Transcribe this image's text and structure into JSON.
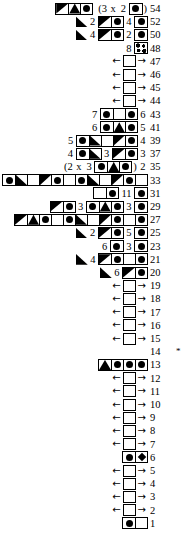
{
  "meta": {
    "row_number_note": "*",
    "colors": {
      "ink": "#000000",
      "paper": "#ffffff"
    }
  },
  "legend": {
    "dot": "filled-circle",
    "diamond": "filled-diamond",
    "blank": "empty-cell",
    "tri_ul": "triangle-lower-left",
    "tri_dl": "triangle-upper-left",
    "peak": "triangle-up",
    "speckle": "speckled-cell"
  },
  "rows": [
    {
      "num": "54",
      "star": "",
      "items": [
        {
          "t": "grid",
          "cells": [
            "tri_dl",
            "peak",
            "dot"
          ]
        },
        {
          "t": "gap"
        },
        {
          "t": "paren",
          "v": "(3"
        },
        {
          "t": "num",
          "v": "x"
        },
        {
          "t": "num",
          "v": "2"
        },
        {
          "t": "grid",
          "cells": [
            "dot"
          ]
        },
        {
          "t": "paren",
          "v": ")"
        }
      ]
    },
    {
      "num": "52",
      "star": "",
      "items": [
        {
          "t": "tri",
          "d": "ul"
        },
        {
          "t": "num",
          "v": "2"
        },
        {
          "t": "grid",
          "cells": [
            "tri_dl",
            "dot"
          ]
        },
        {
          "t": "num",
          "v": "4"
        },
        {
          "t": "grid",
          "cells": [
            "dot"
          ]
        }
      ]
    },
    {
      "num": "50",
      "star": "",
      "items": [
        {
          "t": "tri",
          "d": "ul"
        },
        {
          "t": "num",
          "v": "4"
        },
        {
          "t": "grid",
          "cells": [
            "tri_dl",
            "dot"
          ]
        },
        {
          "t": "num",
          "v": "2"
        },
        {
          "t": "grid",
          "cells": [
            "dot"
          ]
        }
      ]
    },
    {
      "num": "48",
      "star": "",
      "items": [
        {
          "t": "num",
          "v": "8"
        },
        {
          "t": "grid",
          "cells": [
            "speckle"
          ]
        }
      ]
    },
    {
      "num": "47",
      "star": "",
      "items": [
        {
          "t": "arrowbox"
        }
      ]
    },
    {
      "num": "46",
      "star": "",
      "items": [
        {
          "t": "arrowbox"
        }
      ]
    },
    {
      "num": "45",
      "star": "",
      "items": [
        {
          "t": "arrowbox"
        }
      ]
    },
    {
      "num": "44",
      "star": "",
      "items": [
        {
          "t": "arrowbox"
        }
      ]
    },
    {
      "num": "43",
      "star": "",
      "items": [
        {
          "t": "num",
          "v": "7"
        },
        {
          "t": "grid",
          "cells": [
            "dot",
            "blank",
            "dot"
          ]
        },
        {
          "t": "num",
          "v": "6"
        }
      ]
    },
    {
      "num": "41",
      "star": "",
      "items": [
        {
          "t": "num",
          "v": "6"
        },
        {
          "t": "grid",
          "cells": [
            "dot",
            "peak",
            "dot"
          ]
        },
        {
          "t": "num",
          "v": "5"
        }
      ]
    },
    {
      "num": "39",
      "star": "",
      "items": [
        {
          "t": "num",
          "v": "5"
        },
        {
          "t": "grid",
          "cells": [
            "dot",
            "tri_ul",
            "blank",
            "tri_dl",
            "dot"
          ]
        },
        {
          "t": "num",
          "v": "4"
        }
      ]
    },
    {
      "num": "37",
      "star": "",
      "items": [
        {
          "t": "num",
          "v": "4"
        },
        {
          "t": "grid",
          "cells": [
            "dot",
            "tri_ul"
          ]
        },
        {
          "t": "num",
          "v": "3"
        },
        {
          "t": "grid",
          "cells": [
            "tri_dl",
            "dot"
          ]
        },
        {
          "t": "num",
          "v": "3"
        }
      ]
    },
    {
      "num": "35",
      "star": "",
      "items": [
        {
          "t": "paren",
          "v": "(2"
        },
        {
          "t": "num",
          "v": "x"
        },
        {
          "t": "num",
          "v": "3"
        },
        {
          "t": "grid",
          "cells": [
            "dot",
            "peak",
            "dot"
          ]
        },
        {
          "t": "paren",
          "v": ")"
        },
        {
          "t": "num",
          "v": "2"
        }
      ]
    },
    {
      "num": "33",
      "star": "",
      "items": [
        {
          "t": "num",
          "v": "2"
        },
        {
          "t": "grid",
          "cells": [
            "dot",
            "tri_ul",
            "blank",
            "tri_dl",
            "dot",
            "blank",
            "dot",
            "tri_ul",
            "blank",
            "tri_dl",
            "dot",
            "blank"
          ]
        }
      ]
    },
    {
      "num": "31",
      "star": "",
      "items": [
        {
          "t": "grid",
          "cells": [
            "blank",
            "dot"
          ]
        },
        {
          "t": "num",
          "v": "11"
        },
        {
          "t": "grid",
          "cells": [
            "dot"
          ]
        }
      ]
    },
    {
      "num": "29",
      "star": "",
      "items": [
        {
          "t": "grid",
          "cells": [
            "tri_dl",
            "dot"
          ]
        },
        {
          "t": "num",
          "v": "3"
        },
        {
          "t": "grid",
          "cells": [
            "dot",
            "peak",
            "dot"
          ]
        },
        {
          "t": "num",
          "v": "3"
        },
        {
          "t": "grid",
          "cells": [
            "dot"
          ]
        }
      ]
    },
    {
      "num": "27",
      "star": "",
      "items": [
        {
          "t": "grid",
          "cells": [
            "tri_dl",
            "peak",
            "dot",
            "blank",
            "dot",
            "tri_ul",
            "blank",
            "tri_dl",
            "dot",
            "blank",
            "dot"
          ]
        }
      ]
    },
    {
      "num": "25",
      "star": "",
      "items": [
        {
          "t": "tri",
          "d": "ul"
        },
        {
          "t": "num",
          "v": "2"
        },
        {
          "t": "grid",
          "cells": [
            "tri_dl",
            "dot"
          ]
        },
        {
          "t": "num",
          "v": "5"
        },
        {
          "t": "grid",
          "cells": [
            "dot"
          ]
        }
      ]
    },
    {
      "num": "23",
      "star": "",
      "items": [
        {
          "t": "num",
          "v": "6"
        },
        {
          "t": "grid",
          "cells": [
            "dot"
          ]
        },
        {
          "t": "num",
          "v": "3"
        },
        {
          "t": "grid",
          "cells": [
            "dot"
          ]
        }
      ]
    },
    {
      "num": "21",
      "star": "",
      "items": [
        {
          "t": "tri",
          "d": "ul"
        },
        {
          "t": "num",
          "v": "4"
        },
        {
          "t": "grid",
          "cells": [
            "tri_dl",
            "dot",
            "blank",
            "dot"
          ]
        }
      ]
    },
    {
      "num": "20",
      "star": "",
      "items": [
        {
          "t": "tri",
          "d": "ul"
        },
        {
          "t": "num",
          "v": "6"
        },
        {
          "t": "grid",
          "cells": [
            "tri_dl",
            "dot"
          ]
        }
      ]
    },
    {
      "num": "19",
      "star": "",
      "items": [
        {
          "t": "arrowbox"
        }
      ]
    },
    {
      "num": "18",
      "star": "",
      "items": [
        {
          "t": "arrowbox"
        }
      ]
    },
    {
      "num": "17",
      "star": "",
      "items": [
        {
          "t": "arrowbox"
        }
      ]
    },
    {
      "num": "16",
      "star": "",
      "items": [
        {
          "t": "arrowbox"
        }
      ]
    },
    {
      "num": "15",
      "star": "",
      "items": [
        {
          "t": "arrowbox"
        }
      ]
    },
    {
      "num": "14",
      "star": "*",
      "items": []
    },
    {
      "num": "13",
      "star": "",
      "items": [
        {
          "t": "grid",
          "cells": [
            "peak",
            "dot",
            "dot",
            "dot"
          ]
        }
      ]
    },
    {
      "num": "12",
      "star": "",
      "items": [
        {
          "t": "arrowbox"
        }
      ]
    },
    {
      "num": "11",
      "star": "",
      "items": [
        {
          "t": "arrowbox"
        }
      ]
    },
    {
      "num": "10",
      "star": "",
      "items": [
        {
          "t": "arrowbox"
        }
      ]
    },
    {
      "num": "9",
      "star": "",
      "items": [
        {
          "t": "arrowbox"
        }
      ]
    },
    {
      "num": "8",
      "star": "",
      "items": [
        {
          "t": "arrowbox"
        }
      ]
    },
    {
      "num": "7",
      "star": "",
      "items": [
        {
          "t": "arrowbox"
        }
      ]
    },
    {
      "num": "6",
      "star": "",
      "items": [
        {
          "t": "grid",
          "cells": [
            "dot",
            "diamond"
          ]
        }
      ]
    },
    {
      "num": "5",
      "star": "",
      "items": [
        {
          "t": "arrowbox"
        }
      ]
    },
    {
      "num": "4",
      "star": "",
      "items": [
        {
          "t": "arrowbox"
        }
      ]
    },
    {
      "num": "3",
      "star": "",
      "items": [
        {
          "t": "arrowbox"
        }
      ]
    },
    {
      "num": "2",
      "star": "",
      "items": [
        {
          "t": "arrowbox"
        }
      ]
    },
    {
      "num": "1",
      "star": "",
      "items": [
        {
          "t": "grid",
          "cells": [
            "dot",
            "blank"
          ]
        }
      ]
    }
  ],
  "arrow": {
    "left": "←",
    "right": "→"
  }
}
